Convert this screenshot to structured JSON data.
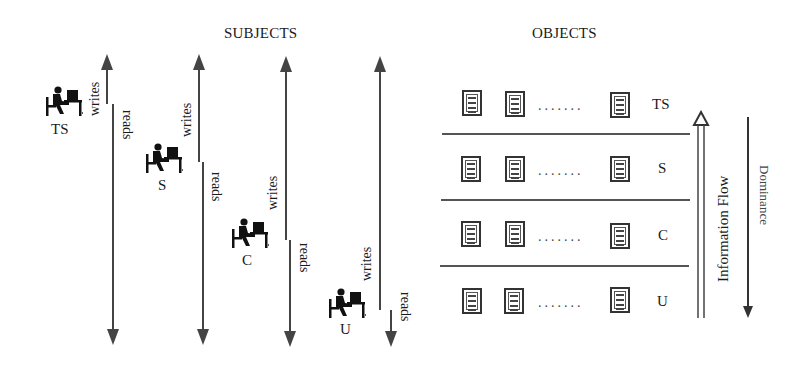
{
  "headers": {
    "subjects": "SUBJECTS",
    "objects": "OBJECTS"
  },
  "subjects": [
    {
      "label": "TS",
      "writes": "writes",
      "reads": "reads"
    },
    {
      "label": "S",
      "writes": "writes",
      "reads": "reads"
    },
    {
      "label": "C",
      "writes": "writes",
      "reads": "reads"
    },
    {
      "label": "U",
      "writes": "writes",
      "reads": "reads"
    }
  ],
  "objects": {
    "levels": [
      {
        "label": "TS",
        "ellipsis": "......."
      },
      {
        "label": "S",
        "ellipsis": "......."
      },
      {
        "label": "C",
        "ellipsis": "......."
      },
      {
        "label": "U",
        "ellipsis": "......."
      }
    ]
  },
  "axes": {
    "information_flow": "Information Flow",
    "dominance": "Dominance"
  },
  "icons": {
    "subject": "person-at-computer-icon",
    "object": "document-icon"
  }
}
